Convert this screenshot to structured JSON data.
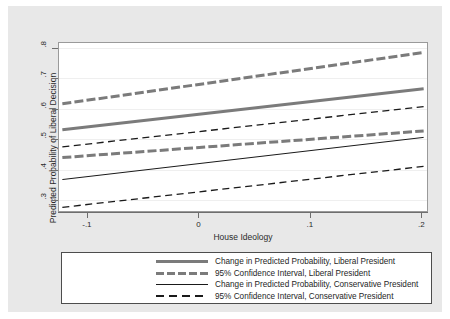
{
  "figure": {
    "background_color": "#e8e8e8",
    "plot_background_color": "#ffffff",
    "liberal_color": "#7b7b7b",
    "conservative_color": "#1a1a1a"
  },
  "axes": {
    "y_title": "Predicted Probability of Liberal Decision",
    "x_title": "House Ideology",
    "y_ticks": [
      ".3",
      ".4",
      ".5",
      ".6",
      ".7",
      ".8"
    ],
    "x_ticks": [
      "-.1",
      "0",
      ".1",
      ".2"
    ]
  },
  "legend": {
    "items": [
      {
        "label": "Change in Predicted Probability, Liberal President",
        "style": "lk-thick-solid"
      },
      {
        "label": "95% Confidence Interval, Liberal President",
        "style": "lk-thick-dash"
      },
      {
        "label": "Change in Predicted Probability, Conservative President",
        "style": "lk-thin-solid"
      },
      {
        "label": "95% Confidence Interval, Conservative President",
        "style": "lk-thin-dash"
      }
    ]
  },
  "chart_data": {
    "type": "line",
    "title": "",
    "xlabel": "House Ideology",
    "ylabel": "Predicted Probability of Liberal Decision",
    "xlim": [
      -0.125,
      0.205
    ],
    "ylim": [
      0.265,
      0.815
    ],
    "x_ticks": [
      -0.1,
      0,
      0.1,
      0.2
    ],
    "y_ticks": [
      0.3,
      0.4,
      0.5,
      0.6,
      0.7,
      0.8
    ],
    "grid": "horizontal",
    "legend_position": "below",
    "x": [
      -0.122,
      0.202
    ],
    "series": [
      {
        "name": "Change in Predicted Probability, Liberal President",
        "values": [
          0.531,
          0.665
        ],
        "color": "#7b7b7b",
        "width": 3,
        "dash": "none"
      },
      {
        "name": "95% Confidence Interval, Liberal President (upper)",
        "values": [
          0.616,
          0.784
        ],
        "color": "#7b7b7b",
        "width": 3,
        "dash": "long"
      },
      {
        "name": "95% Confidence Interval, Liberal President (lower)",
        "values": [
          0.44,
          0.527
        ],
        "color": "#7b7b7b",
        "width": 3,
        "dash": "long"
      },
      {
        "name": "Change in Predicted Probability, Conservative President",
        "values": [
          0.368,
          0.506
        ],
        "color": "#1a1a1a",
        "width": 1,
        "dash": "none"
      },
      {
        "name": "95% Confidence Interval, Conservative President (upper)",
        "values": [
          0.475,
          0.607
        ],
        "color": "#1a1a1a",
        "width": 1.3,
        "dash": "medium"
      },
      {
        "name": "95% Confidence Interval, Conservative President (lower)",
        "values": [
          0.277,
          0.411
        ],
        "color": "#1a1a1a",
        "width": 1.3,
        "dash": "medium"
      }
    ]
  }
}
